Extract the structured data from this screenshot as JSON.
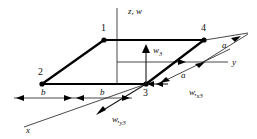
{
  "figure": {
    "type": "engineering-diagram",
    "background_color": "#ffffff",
    "line_color": "#000000"
  },
  "axes": [
    {
      "id": "z",
      "label": "z, w",
      "orientation": "vertical-up"
    },
    {
      "id": "y",
      "label": "y",
      "orientation": "horizontal-right"
    },
    {
      "id": "x",
      "label": "x",
      "orientation": "diagonal-lower-left"
    }
  ],
  "nodes": [
    {
      "id": "n1",
      "label": "1",
      "position": "top-left-of-plate"
    },
    {
      "id": "n2",
      "label": "2",
      "position": "bottom-left-of-plate"
    },
    {
      "id": "n3",
      "label": "3",
      "position": "bottom-right-of-plate"
    },
    {
      "id": "n4",
      "label": "4",
      "position": "top-right-of-plate"
    }
  ],
  "dof_labels": [
    {
      "id": "w3",
      "base": "w",
      "subscript": "3",
      "label": "w3",
      "direction": "up",
      "description": "transverse displacement at node 3"
    },
    {
      "id": "wx3",
      "base": "w,",
      "subscript": "x3",
      "label": "w,x3",
      "direction": "left",
      "description": "rotation slope about x at node 3"
    },
    {
      "id": "wy3",
      "base": "w,",
      "subscript": "y3",
      "label": "w,y3",
      "direction": "lower-left",
      "description": "rotation slope about y at node 3"
    }
  ],
  "dimensions": [
    {
      "id": "b-left",
      "label": "b",
      "orientation": "horizontal",
      "description": "half-width left segment"
    },
    {
      "id": "b-right",
      "label": "b",
      "orientation": "horizontal",
      "description": "half-width right segment"
    },
    {
      "id": "a-lower",
      "label": "a",
      "orientation": "diagonal",
      "description": "half-length lower segment"
    },
    {
      "id": "a-upper",
      "label": "a",
      "orientation": "diagonal",
      "description": "half-length upper segment"
    }
  ]
}
